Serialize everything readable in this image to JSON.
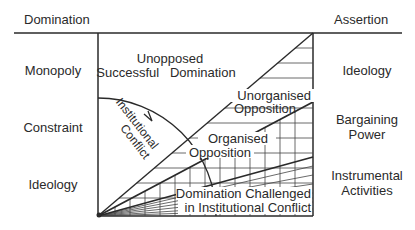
{
  "header": {
    "left_title": "Domination",
    "right_title": "Assertion"
  },
  "left_column": {
    "items": [
      "Monopoly",
      "Constraint",
      "Ideology"
    ]
  },
  "right_column": {
    "items": [
      {
        "line1": "Ideology",
        "line2": ""
      },
      {
        "line1": "Bargaining",
        "line2": "Power"
      },
      {
        "line1": "Instrumental",
        "line2": "Activities"
      }
    ]
  },
  "regions": {
    "unopposed_line1": "Unopposed",
    "unopposed_line2": "Successful   Domination",
    "unorganised_line1": "Unorganised",
    "unorganised_line2": "Opposition",
    "organised_line1": "Organised",
    "organised_line2": "Opposition",
    "challenged_line1": "Domination Challenged",
    "challenged_line2": "in Institutional Conflict",
    "arc_label_line1": "Institutional",
    "arc_label_line2": "Conflict"
  },
  "colors": {
    "line": "#2a2a2a",
    "background": "#ffffff"
  }
}
